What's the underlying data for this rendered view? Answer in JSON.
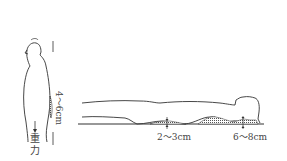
{
  "diagram": {
    "standing_figure": {
      "lumbar_gap_label": "4～6cm",
      "gravity_label_line1": "重",
      "gravity_label_line2": "力"
    },
    "lying_figure": {
      "waist_gap_label": "2～3cm",
      "neck_gap_label": "6～8cm"
    },
    "colors": {
      "line": "#333333",
      "hatch": "#555555",
      "background": "#ffffff"
    }
  }
}
